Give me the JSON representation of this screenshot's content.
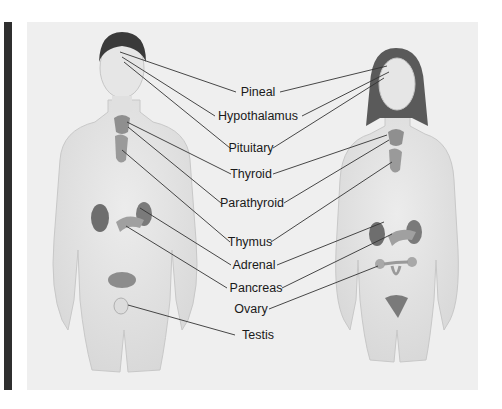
{
  "figure": {
    "subjects": [
      "male-figure",
      "female-figure"
    ],
    "labels": [
      {
        "id": "pineal",
        "text": "Pineal",
        "x": 258,
        "y": 92
      },
      {
        "id": "hypothalamus",
        "text": "Hypothalamus",
        "x": 258,
        "y": 116
      },
      {
        "id": "pituitary",
        "text": "Pituitary",
        "x": 251,
        "y": 148
      },
      {
        "id": "thyroid",
        "text": "Thyroid",
        "x": 251,
        "y": 174
      },
      {
        "id": "parathyroid",
        "text": "Parathyroid",
        "x": 252,
        "y": 203
      },
      {
        "id": "thymus",
        "text": "Thymus",
        "x": 250,
        "y": 242
      },
      {
        "id": "adrenal",
        "text": "Adrenal",
        "x": 254,
        "y": 265
      },
      {
        "id": "pancreas",
        "text": "Pancreas",
        "x": 256,
        "y": 288
      },
      {
        "id": "ovary",
        "text": "Ovary",
        "x": 251,
        "y": 309
      },
      {
        "id": "testis",
        "text": "Testis",
        "x": 258,
        "y": 335
      }
    ],
    "colors": {
      "panel": "#efefef",
      "side_bar": "#2f2f2f",
      "skin": "#e4e4e4",
      "hair": "#3a3a3a",
      "gland": "#8a8a8a",
      "leader_line": "#333333"
    }
  }
}
